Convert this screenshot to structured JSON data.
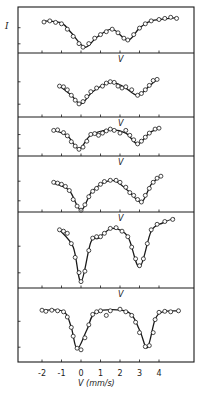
{
  "chart_data": {
    "type": "line",
    "title": "",
    "xlabel": "V (mm/s)",
    "ylabel": "I",
    "xlim": [
      -3.0,
      5.8
    ],
    "x_ticks": [
      -2,
      -1,
      0,
      1,
      2,
      3,
      4
    ],
    "x_tick_labels": [
      "-2",
      "-1",
      "0",
      "1",
      "2",
      "3",
      "4"
    ],
    "grid": false,
    "legend": "none",
    "layout": "6 vertically stacked panels sharing x axis; each panel labeled 'V' near top at x≈2",
    "panel_label": "V",
    "series": [
      {
        "name": "panel-1",
        "points": [
          [
            -1.9,
            0.25
          ],
          [
            -1.6,
            0.22
          ],
          [
            -1.3,
            0.26
          ],
          [
            -1.0,
            0.3
          ],
          [
            -0.7,
            0.45
          ],
          [
            -0.4,
            0.65
          ],
          [
            -0.1,
            0.85
          ],
          [
            0.1,
            0.95
          ],
          [
            0.4,
            0.85
          ],
          [
            0.7,
            0.7
          ],
          [
            1.0,
            0.6
          ],
          [
            1.3,
            0.52
          ],
          [
            1.6,
            0.45
          ],
          [
            1.9,
            0.55
          ],
          [
            2.2,
            0.7
          ],
          [
            2.4,
            0.75
          ],
          [
            2.7,
            0.6
          ],
          [
            3.0,
            0.42
          ],
          [
            3.3,
            0.3
          ],
          [
            3.6,
            0.22
          ],
          [
            4.0,
            0.18
          ],
          [
            4.3,
            0.15
          ],
          [
            4.6,
            0.12
          ],
          [
            4.9,
            0.15
          ]
        ],
        "fit": [
          [
            -1.9,
            0.22
          ],
          [
            -1.0,
            0.28
          ],
          [
            -0.5,
            0.55
          ],
          [
            0.2,
            0.95
          ],
          [
            0.8,
            0.68
          ],
          [
            1.6,
            0.45
          ],
          [
            2.4,
            0.76
          ],
          [
            3.0,
            0.42
          ],
          [
            3.6,
            0.22
          ],
          [
            4.9,
            0.13
          ]
        ]
      },
      {
        "name": "panel-2",
        "points": [
          [
            -1.1,
            0.3
          ],
          [
            -0.9,
            0.32
          ],
          [
            -0.7,
            0.4
          ],
          [
            -0.5,
            0.55
          ],
          [
            -0.3,
            0.68
          ],
          [
            -0.1,
            0.78
          ],
          [
            0.1,
            0.72
          ],
          [
            0.3,
            0.58
          ],
          [
            0.5,
            0.45
          ],
          [
            0.8,
            0.35
          ],
          [
            1.1,
            0.3
          ],
          [
            1.3,
            0.22
          ],
          [
            1.5,
            0.18
          ],
          [
            1.7,
            0.2
          ],
          [
            1.9,
            0.3
          ],
          [
            2.1,
            0.35
          ],
          [
            2.3,
            0.32
          ],
          [
            2.6,
            0.4
          ],
          [
            2.9,
            0.55
          ],
          [
            3.1,
            0.5
          ],
          [
            3.3,
            0.4
          ],
          [
            3.5,
            0.28
          ],
          [
            3.7,
            0.15
          ],
          [
            3.9,
            0.12
          ]
        ],
        "fit": [
          [
            -1.1,
            0.3
          ],
          [
            -0.5,
            0.55
          ],
          [
            0.0,
            0.78
          ],
          [
            0.6,
            0.45
          ],
          [
            1.5,
            0.2
          ],
          [
            2.2,
            0.32
          ],
          [
            2.9,
            0.55
          ],
          [
            3.5,
            0.3
          ],
          [
            3.9,
            0.12
          ]
        ]
      },
      {
        "name": "panel-3",
        "points": [
          [
            -1.4,
            0.2
          ],
          [
            -1.2,
            0.18
          ],
          [
            -0.9,
            0.28
          ],
          [
            -0.7,
            0.4
          ],
          [
            -0.5,
            0.62
          ],
          [
            -0.3,
            0.78
          ],
          [
            -0.1,
            0.9
          ],
          [
            0.1,
            0.82
          ],
          [
            0.3,
            0.6
          ],
          [
            0.5,
            0.35
          ],
          [
            0.7,
            0.32
          ],
          [
            0.9,
            0.38
          ],
          [
            1.1,
            0.3
          ],
          [
            1.3,
            0.22
          ],
          [
            1.5,
            0.15
          ],
          [
            1.7,
            0.2
          ],
          [
            2.0,
            0.3
          ],
          [
            2.3,
            0.2
          ],
          [
            2.5,
            0.38
          ],
          [
            2.7,
            0.55
          ],
          [
            2.9,
            0.7
          ],
          [
            3.1,
            0.6
          ],
          [
            3.3,
            0.45
          ],
          [
            3.5,
            0.3
          ],
          [
            3.8,
            0.15
          ],
          [
            4.0,
            0.12
          ]
        ],
        "fit": [
          [
            -1.4,
            0.2
          ],
          [
            -0.7,
            0.4
          ],
          [
            -0.1,
            0.88
          ],
          [
            0.5,
            0.38
          ],
          [
            1.5,
            0.18
          ],
          [
            2.3,
            0.3
          ],
          [
            2.9,
            0.7
          ],
          [
            3.5,
            0.3
          ],
          [
            4.0,
            0.12
          ]
        ]
      },
      {
        "name": "panel-4",
        "points": [
          [
            -1.4,
            0.3
          ],
          [
            -1.2,
            0.32
          ],
          [
            -1.0,
            0.35
          ],
          [
            -0.8,
            0.4
          ],
          [
            -0.6,
            0.5
          ],
          [
            -0.4,
            0.72
          ],
          [
            -0.2,
            0.88
          ],
          [
            0.0,
            0.98
          ],
          [
            0.2,
            0.85
          ],
          [
            0.4,
            0.65
          ],
          [
            0.6,
            0.52
          ],
          [
            0.8,
            0.45
          ],
          [
            1.0,
            0.35
          ],
          [
            1.2,
            0.28
          ],
          [
            1.5,
            0.25
          ],
          [
            1.8,
            0.25
          ],
          [
            2.0,
            0.3
          ],
          [
            2.3,
            0.42
          ],
          [
            2.5,
            0.55
          ],
          [
            2.7,
            0.62
          ],
          [
            2.9,
            0.72
          ],
          [
            3.1,
            0.78
          ],
          [
            3.3,
            0.62
          ],
          [
            3.5,
            0.45
          ],
          [
            3.7,
            0.3
          ],
          [
            3.9,
            0.2
          ],
          [
            4.1,
            0.15
          ]
        ],
        "fit": [
          [
            -1.4,
            0.32
          ],
          [
            -0.6,
            0.5
          ],
          [
            0.0,
            0.98
          ],
          [
            0.6,
            0.5
          ],
          [
            1.6,
            0.25
          ],
          [
            2.4,
            0.5
          ],
          [
            3.1,
            0.78
          ],
          [
            3.6,
            0.35
          ],
          [
            4.1,
            0.15
          ]
        ]
      },
      {
        "name": "panel-5",
        "points": [
          [
            -1.1,
            0.2
          ],
          [
            -0.9,
            0.22
          ],
          [
            -0.7,
            0.25
          ],
          [
            -0.5,
            0.4
          ],
          [
            -0.3,
            0.6
          ],
          [
            -0.1,
            0.82
          ],
          [
            0.0,
            0.95
          ],
          [
            0.2,
            0.8
          ],
          [
            0.4,
            0.5
          ],
          [
            0.6,
            0.32
          ],
          [
            0.8,
            0.3
          ],
          [
            1.0,
            0.3
          ],
          [
            1.2,
            0.25
          ],
          [
            1.5,
            0.18
          ],
          [
            1.8,
            0.17
          ],
          [
            2.1,
            0.22
          ],
          [
            2.4,
            0.3
          ],
          [
            2.6,
            0.45
          ],
          [
            2.8,
            0.62
          ],
          [
            3.0,
            0.72
          ],
          [
            3.2,
            0.62
          ],
          [
            3.4,
            0.4
          ],
          [
            3.6,
            0.2
          ],
          [
            3.9,
            0.12
          ],
          [
            4.3,
            0.08
          ],
          [
            4.7,
            0.05
          ]
        ],
        "fit": [
          [
            -1.1,
            0.2
          ],
          [
            -0.4,
            0.45
          ],
          [
            0.0,
            0.95
          ],
          [
            0.5,
            0.38
          ],
          [
            0.9,
            0.32
          ],
          [
            1.6,
            0.18
          ],
          [
            2.4,
            0.3
          ],
          [
            3.0,
            0.74
          ],
          [
            3.6,
            0.22
          ],
          [
            4.2,
            0.1
          ],
          [
            4.8,
            0.03
          ]
        ]
      },
      {
        "name": "panel-6",
        "points": [
          [
            -2.0,
            0.12
          ],
          [
            -1.8,
            0.14
          ],
          [
            -1.5,
            0.12
          ],
          [
            -1.2,
            0.13
          ],
          [
            -0.9,
            0.15
          ],
          [
            -0.7,
            0.25
          ],
          [
            -0.5,
            0.45
          ],
          [
            -0.4,
            0.62
          ],
          [
            -0.2,
            0.85
          ],
          [
            0.0,
            0.88
          ],
          [
            0.2,
            0.65
          ],
          [
            0.4,
            0.4
          ],
          [
            0.6,
            0.2
          ],
          [
            0.8,
            0.15
          ],
          [
            1.0,
            0.13
          ],
          [
            1.3,
            0.22
          ],
          [
            1.5,
            0.13
          ],
          [
            2.0,
            0.1
          ],
          [
            2.3,
            0.15
          ],
          [
            2.6,
            0.22
          ],
          [
            2.8,
            0.35
          ],
          [
            3.0,
            0.55
          ],
          [
            3.3,
            0.82
          ],
          [
            3.5,
            0.8
          ],
          [
            3.7,
            0.55
          ],
          [
            3.8,
            0.3
          ],
          [
            4.0,
            0.16
          ],
          [
            4.3,
            0.14
          ],
          [
            4.6,
            0.15
          ],
          [
            5.0,
            0.13
          ]
        ],
        "fit": [
          [
            -2.0,
            0.12
          ],
          [
            -0.9,
            0.14
          ],
          [
            -0.5,
            0.45
          ],
          [
            -0.2,
            0.86
          ],
          [
            0.3,
            0.5
          ],
          [
            0.8,
            0.15
          ],
          [
            2.4,
            0.15
          ],
          [
            3.0,
            0.5
          ],
          [
            3.4,
            0.84
          ],
          [
            3.8,
            0.3
          ],
          [
            4.2,
            0.15
          ],
          [
            5.0,
            0.13
          ]
        ]
      }
    ]
  },
  "axis": {
    "ylabel": "I",
    "xlabel": "V (mm/s)",
    "tick_labels": [
      "-2",
      "-1",
      "0",
      "1",
      "2",
      "3",
      "4"
    ],
    "panel_label": "V"
  },
  "colors": {
    "ink": "#1a1a1a",
    "background": "#ffffff"
  }
}
